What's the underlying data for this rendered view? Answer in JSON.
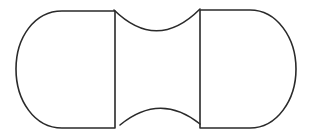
{
  "diagram": {
    "stroke_color": "#2a2a2a",
    "background_color": "#ffffff",
    "stroke_width": 1.6,
    "parts": {
      "left_cap": {
        "shape": "D-shape (rounded left side)",
        "flat_edge_x": 115,
        "top_y": 11,
        "bottom_y": 128,
        "leftmost_x": 16
      },
      "right_cap": {
        "shape": "D-shape (rounded right side)",
        "flat_edge_x": 200,
        "top_y": 10,
        "bottom_y": 128,
        "rightmost_x": 296
      },
      "top_arc": {
        "shape": "concave arc",
        "from": [
          115,
          11
        ],
        "to": [
          200,
          10
        ],
        "lowest_y": 31
      },
      "bottom_arc": {
        "shape": "convex-up arc (gap at ends)",
        "from": [
          120,
          124
        ],
        "to": [
          200,
          124
        ],
        "highest_y": 108
      }
    }
  }
}
